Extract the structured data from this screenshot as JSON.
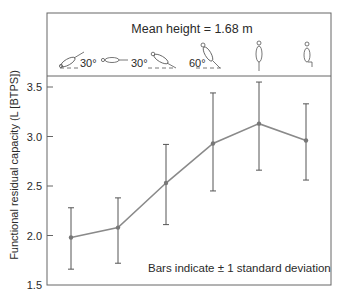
{
  "chart_data": {
    "type": "line",
    "title": "Mean height = 1.68 m",
    "xlabel": "",
    "ylabel": "Functional residual capacity (L [BTPS])",
    "ylim": [
      1.5,
      3.5
    ],
    "yticks": [
      1.5,
      2.0,
      2.5,
      3.0,
      3.5
    ],
    "ytick_labels": [
      "1.5",
      "2.0",
      "2.5",
      "3.0",
      "3.5"
    ],
    "grid": false,
    "categories": [
      "Supine, head-down 30°",
      "Supine (horizontal)",
      "Supine, head-up 30°",
      "Supine, head-up 60°",
      "Standing",
      "Sitting"
    ],
    "category_angle_labels": [
      "30°",
      "",
      "30°",
      "60°",
      "",
      ""
    ],
    "series": [
      {
        "name": "FRC",
        "values": [
          1.98,
          2.08,
          2.53,
          2.93,
          3.13,
          2.96
        ],
        "error_low": [
          1.66,
          1.72,
          2.11,
          2.45,
          2.66,
          2.56
        ],
        "error_high": [
          2.28,
          2.38,
          2.92,
          3.44,
          3.55,
          3.33
        ],
        "color": "#777777"
      }
    ],
    "annotations": [
      "Bars indicate ± 1 standard deviation"
    ],
    "legend_position": "bottom-right inside plot"
  },
  "header": {
    "title": "Mean height = 1.68 m",
    "postures": [
      {
        "name": "head-down-tilt",
        "angle_label": "30°"
      },
      {
        "name": "supine",
        "angle_label": ""
      },
      {
        "name": "head-up-tilt-30",
        "angle_label": "30°"
      },
      {
        "name": "head-up-tilt-60",
        "angle_label": "60°"
      },
      {
        "name": "standing",
        "angle_label": ""
      },
      {
        "name": "sitting",
        "angle_label": ""
      }
    ]
  },
  "note": "Bars indicate ± 1 standard deviation",
  "colors": {
    "axis": "#555555",
    "line": "#808080",
    "errorbar": "#555555",
    "text": "#2a2a2a"
  }
}
